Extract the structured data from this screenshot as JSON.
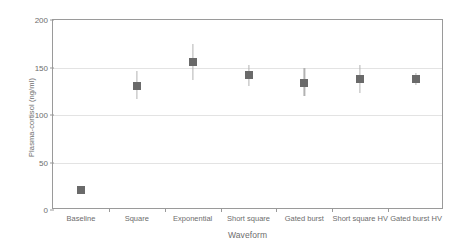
{
  "chart_data": {
    "type": "scatter",
    "title": "",
    "xlabel": "Waveform",
    "ylabel": "Plasma-cortisol (ng/ml)",
    "categories": [
      "Baseline",
      "Square",
      "Exponential",
      "Short square",
      "Gated burst",
      "Short square HV",
      "Gated burst HV"
    ],
    "values": [
      21,
      131,
      156,
      142,
      134,
      138,
      138
    ],
    "error_low": [
      21,
      117,
      137,
      131,
      120,
      123,
      132
    ],
    "error_high": [
      21,
      146,
      175,
      153,
      149,
      153,
      144
    ],
    "ylim": [
      0,
      200
    ],
    "yticks": [
      0,
      50,
      100,
      150,
      200
    ],
    "ytick_labels": [
      "0",
      "50",
      "100",
      "150",
      "200"
    ],
    "grid": true,
    "legend": "none",
    "marker_color": "#6a6a6a",
    "errorbar_color": "#b2b2b2",
    "gridline_color": "#e3e3e3",
    "axis_color": "#9a9a9a",
    "text_color": "#6d6d6d"
  }
}
